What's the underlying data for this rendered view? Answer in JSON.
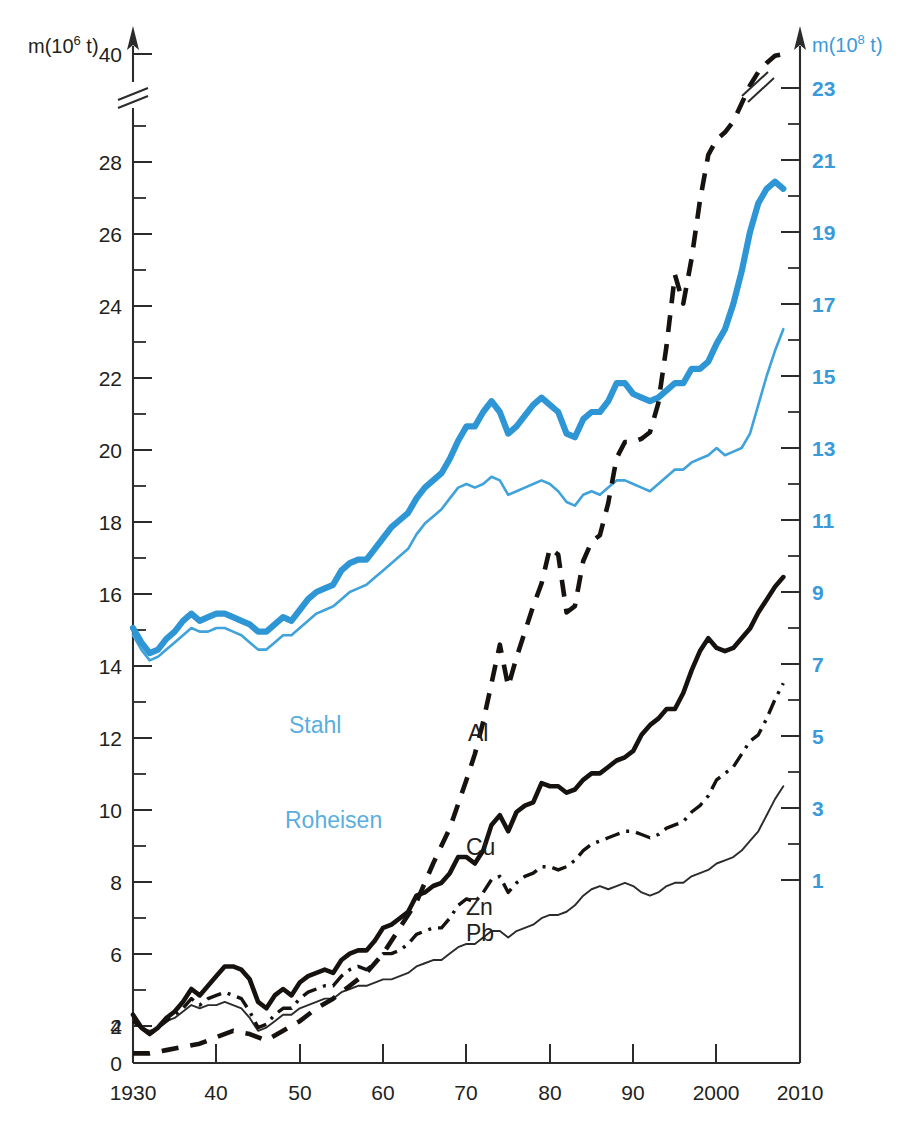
{
  "chart_data": {
    "type": "line",
    "title": "",
    "subtitle": "",
    "xlabel": "",
    "ylabel_left": "m(10^6 t)",
    "ylabel_right": "m(10^8 t)",
    "left_axis": {
      "label_prefix": "m(10",
      "label_exponent": "6",
      "label_suffix": " t)",
      "ticks": [
        0,
        2,
        4,
        6,
        8,
        10,
        12,
        14,
        16,
        18,
        20,
        22,
        24,
        26,
        28,
        40
      ],
      "tick_labels": [
        "0",
        "2",
        "4",
        "6",
        "8",
        "10",
        "12",
        "14",
        "16",
        "18",
        "20",
        "22",
        "24",
        "26",
        "28",
        "40"
      ],
      "has_break": true,
      "break_between": [
        28,
        40
      ],
      "range": [
        0,
        40
      ],
      "unit": "10^6 t"
    },
    "right_axis": {
      "label_prefix": "m(10",
      "label_exponent": "8",
      "label_suffix": " t)",
      "ticks": [
        1,
        3,
        5,
        7,
        9,
        11,
        13,
        15,
        17,
        19,
        21,
        23
      ],
      "tick_labels": [
        "1",
        "3",
        "5",
        "7",
        "9",
        "11",
        "13",
        "15",
        "17",
        "19",
        "21",
        "23"
      ],
      "has_break": true,
      "range": [
        0,
        24
      ],
      "unit": "10^8 t",
      "color": "#3a9ad9"
    },
    "x_axis": {
      "tick_values": [
        1930,
        1940,
        1950,
        1960,
        1970,
        1980,
        1990,
        2000,
        2010
      ],
      "tick_labels": [
        "1930",
        "40",
        "50",
        "60",
        "70",
        "80",
        "90",
        "2000",
        "2010"
      ],
      "range": [
        1930,
        2010
      ]
    },
    "grid": false,
    "legend_position": "inline-labels",
    "series": [
      {
        "name": "Stahl",
        "label": "Stahl",
        "axis": "right",
        "color": "#2e96d4",
        "style": "solid-thick",
        "label_xy": [
          1955,
          10.2
        ],
        "x": [
          1930,
          1931,
          1932,
          1933,
          1934,
          1935,
          1936,
          1937,
          1938,
          1939,
          1940,
          1941,
          1942,
          1943,
          1944,
          1945,
          1946,
          1947,
          1948,
          1949,
          1950,
          1951,
          1952,
          1953,
          1954,
          1955,
          1956,
          1957,
          1958,
          1959,
          1960,
          1961,
          1962,
          1963,
          1964,
          1965,
          1966,
          1967,
          1968,
          1969,
          1970,
          1971,
          1972,
          1973,
          1974,
          1975,
          1976,
          1977,
          1978,
          1979,
          1980,
          1981,
          1982,
          1983,
          1984,
          1985,
          1986,
          1987,
          1988,
          1989,
          1990,
          1991,
          1992,
          1993,
          1994,
          1995,
          1996,
          1997,
          1998,
          1999,
          2000,
          2001,
          2002,
          2003,
          2004,
          2005,
          2006,
          2007,
          2008
        ],
        "y": [
          8.0,
          7.6,
          7.3,
          7.4,
          7.7,
          7.9,
          8.2,
          8.4,
          8.2,
          8.3,
          8.4,
          8.4,
          8.3,
          8.2,
          8.1,
          7.9,
          7.9,
          8.1,
          8.3,
          8.2,
          8.5,
          8.8,
          9.0,
          9.1,
          9.2,
          9.6,
          9.8,
          9.9,
          9.9,
          10.2,
          10.5,
          10.8,
          11.0,
          11.2,
          11.6,
          11.9,
          12.1,
          12.3,
          12.7,
          13.2,
          13.6,
          13.6,
          14.0,
          14.3,
          14.0,
          13.4,
          13.6,
          13.9,
          14.2,
          14.4,
          14.2,
          14.0,
          13.4,
          13.3,
          13.8,
          14.0,
          14.0,
          14.3,
          14.8,
          14.8,
          14.5,
          14.4,
          14.3,
          14.4,
          14.6,
          14.8,
          14.8,
          15.2,
          15.2,
          15.4,
          15.9,
          16.3,
          17.0,
          17.9,
          19.0,
          19.8,
          20.2,
          20.4,
          20.2
        ],
        "y_unit_note": "read on right axis, 10^8 t"
      },
      {
        "name": "Roheisen",
        "label": "Roheisen",
        "axis": "right",
        "color": "#3fa2da",
        "style": "solid-thin",
        "label_xy": [
          1959,
          8.1
        ],
        "x": [
          1930,
          1931,
          1932,
          1933,
          1934,
          1935,
          1936,
          1937,
          1938,
          1939,
          1940,
          1941,
          1942,
          1943,
          1944,
          1945,
          1946,
          1947,
          1948,
          1949,
          1950,
          1951,
          1952,
          1953,
          1954,
          1955,
          1956,
          1957,
          1958,
          1959,
          1960,
          1961,
          1962,
          1963,
          1964,
          1965,
          1966,
          1967,
          1968,
          1969,
          1970,
          1971,
          1972,
          1973,
          1974,
          1975,
          1976,
          1977,
          1978,
          1979,
          1980,
          1981,
          1982,
          1983,
          1984,
          1985,
          1986,
          1987,
          1988,
          1989,
          1990,
          1991,
          1992,
          1993,
          1994,
          1995,
          1996,
          1997,
          1998,
          1999,
          2000,
          2001,
          2002,
          2003,
          2004,
          2005,
          2006,
          2007,
          2008
        ],
        "y": [
          7.8,
          7.4,
          7.1,
          7.2,
          7.4,
          7.6,
          7.8,
          8.0,
          7.9,
          7.9,
          8.0,
          8.0,
          7.9,
          7.8,
          7.6,
          7.4,
          7.4,
          7.6,
          7.8,
          7.8,
          8.0,
          8.2,
          8.4,
          8.5,
          8.6,
          8.8,
          9.0,
          9.1,
          9.2,
          9.4,
          9.6,
          9.8,
          10.0,
          10.2,
          10.6,
          10.9,
          11.1,
          11.3,
          11.6,
          11.9,
          12.0,
          11.9,
          12.0,
          12.2,
          12.1,
          11.7,
          11.8,
          11.9,
          12.0,
          12.1,
          12.0,
          11.8,
          11.5,
          11.4,
          11.7,
          11.8,
          11.7,
          11.9,
          12.1,
          12.1,
          12.0,
          11.9,
          11.8,
          12.0,
          12.2,
          12.4,
          12.4,
          12.6,
          12.7,
          12.8,
          13.0,
          12.8,
          12.9,
          13.0,
          13.4,
          14.2,
          15.0,
          15.7,
          16.3
        ],
        "y_unit_note": "read on left axis scale positions"
      },
      {
        "name": "Al",
        "label": "Al",
        "axis": "left",
        "color": "#16120f",
        "style": "dashed",
        "label_xy": [
          1968,
          9.8
        ],
        "x": [
          1930,
          1932,
          1934,
          1936,
          1938,
          1940,
          1942,
          1944,
          1946,
          1948,
          1950,
          1952,
          1954,
          1956,
          1958,
          1960,
          1962,
          1964,
          1966,
          1968,
          1970,
          1971,
          1972,
          1973,
          1974,
          1975,
          1976,
          1977,
          1978,
          1979,
          1980,
          1981,
          1982,
          1983,
          1984,
          1985,
          1986,
          1987,
          1988,
          1989,
          1990,
          1991,
          1992,
          1993,
          1994,
          1995,
          1996,
          1997,
          1998,
          1999,
          2000,
          2001,
          2002,
          2003,
          2004,
          2005,
          2006,
          2007,
          2008
        ],
        "y": [
          0.3,
          0.3,
          0.4,
          0.5,
          0.6,
          0.8,
          1.0,
          0.9,
          0.7,
          1.0,
          1.3,
          1.7,
          2.0,
          2.4,
          2.8,
          3.4,
          4.2,
          5.0,
          6.2,
          7.3,
          8.8,
          9.6,
          10.6,
          11.8,
          13.0,
          11.7,
          12.6,
          13.4,
          14.2,
          14.9,
          16.0,
          15.8,
          14.0,
          14.2,
          15.6,
          16.2,
          16.4,
          17.4,
          18.8,
          19.3,
          19.3,
          19.4,
          19.6,
          20.5,
          22.3,
          24.5,
          23.6,
          25.0,
          26.8,
          28.8,
          30.5,
          31.3,
          32.5,
          34.5,
          36.5,
          38.0,
          39.0,
          39.8,
          40.0
        ],
        "has_break_near_top": true,
        "y_unit_note": "10^6 t, left axis (axis broken between 28 and 40)"
      },
      {
        "name": "Cu",
        "label": "Cu",
        "axis": "left",
        "color": "#16120f",
        "style": "solid-thick",
        "label_xy": [
          1968,
          7.1
        ],
        "x": [
          1930,
          1931,
          1932,
          1933,
          1934,
          1935,
          1936,
          1937,
          1938,
          1939,
          1940,
          1941,
          1942,
          1943,
          1944,
          1945,
          1946,
          1947,
          1948,
          1949,
          1950,
          1951,
          1952,
          1953,
          1954,
          1955,
          1956,
          1957,
          1958,
          1959,
          1960,
          1961,
          1962,
          1963,
          1964,
          1965,
          1966,
          1967,
          1968,
          1969,
          1970,
          1971,
          1972,
          1973,
          1974,
          1975,
          1976,
          1977,
          1978,
          1979,
          1980,
          1981,
          1982,
          1983,
          1984,
          1985,
          1986,
          1987,
          1988,
          1989,
          1990,
          1991,
          1992,
          1993,
          1994,
          1995,
          1996,
          1997,
          1998,
          1999,
          2000,
          2001,
          2002,
          2003,
          2004,
          2005,
          2006,
          2007,
          2008
        ],
        "y": [
          1.5,
          1.1,
          0.9,
          1.1,
          1.4,
          1.6,
          1.9,
          2.3,
          2.1,
          2.4,
          2.7,
          3.0,
          3.0,
          2.9,
          2.6,
          1.9,
          1.7,
          2.1,
          2.3,
          2.1,
          2.5,
          2.7,
          2.8,
          2.9,
          2.8,
          3.2,
          3.4,
          3.5,
          3.5,
          3.8,
          4.2,
          4.3,
          4.5,
          4.7,
          5.2,
          5.3,
          5.5,
          5.6,
          5.9,
          6.4,
          6.4,
          6.2,
          6.6,
          7.4,
          7.7,
          7.2,
          7.8,
          8.0,
          8.1,
          8.7,
          8.6,
          8.6,
          8.4,
          8.5,
          8.8,
          9.0,
          9.0,
          9.2,
          9.4,
          9.5,
          9.7,
          10.2,
          10.5,
          10.7,
          11.0,
          11.0,
          11.5,
          12.2,
          12.8,
          13.2,
          12.9,
          12.8,
          12.9,
          13.2,
          13.5,
          14.0,
          14.4,
          14.8,
          15.1
        ],
        "y_unit_note": "10^6 t, left axis"
      },
      {
        "name": "Zn",
        "label": "Zn",
        "axis": "left",
        "color": "#16120f",
        "style": "dash-dot",
        "label_xy": [
          1963,
          5.1
        ],
        "x": [
          1930,
          1931,
          1932,
          1933,
          1934,
          1935,
          1936,
          1937,
          1938,
          1939,
          1940,
          1941,
          1942,
          1943,
          1944,
          1945,
          1946,
          1947,
          1948,
          1949,
          1950,
          1951,
          1952,
          1953,
          1954,
          1955,
          1956,
          1957,
          1958,
          1959,
          1960,
          1961,
          1962,
          1963,
          1964,
          1965,
          1966,
          1967,
          1968,
          1969,
          1970,
          1971,
          1972,
          1973,
          1974,
          1975,
          1976,
          1977,
          1978,
          1979,
          1980,
          1981,
          1982,
          1983,
          1984,
          1985,
          1986,
          1987,
          1988,
          1989,
          1990,
          1991,
          1992,
          1993,
          1994,
          1995,
          1996,
          1997,
          1998,
          1999,
          2000,
          2001,
          2002,
          2003,
          2004,
          2005,
          2006,
          2007,
          2008
        ],
        "y": [
          1.3,
          1.1,
          0.9,
          1.1,
          1.3,
          1.5,
          1.7,
          2.0,
          1.8,
          2.0,
          2.1,
          2.2,
          2.1,
          2.0,
          1.6,
          1.1,
          1.2,
          1.5,
          1.7,
          1.7,
          2.0,
          2.2,
          2.3,
          2.4,
          2.4,
          2.7,
          2.9,
          3.0,
          2.9,
          3.1,
          3.4,
          3.4,
          3.5,
          3.7,
          4.0,
          4.1,
          4.2,
          4.2,
          4.5,
          4.9,
          5.1,
          5.0,
          5.3,
          5.7,
          5.8,
          5.3,
          5.6,
          5.8,
          5.9,
          6.1,
          6.1,
          6.0,
          6.1,
          6.3,
          6.6,
          6.8,
          6.9,
          7.0,
          7.1,
          7.2,
          7.2,
          7.1,
          7.0,
          7.1,
          7.3,
          7.4,
          7.5,
          7.8,
          8.0,
          8.3,
          8.8,
          9.0,
          9.2,
          9.6,
          10.0,
          10.2,
          10.7,
          11.3,
          11.8
        ],
        "y_unit_note": "10^6 t, left axis"
      },
      {
        "name": "Pb",
        "label": "Pb",
        "axis": "left",
        "color": "#2b2b2b",
        "style": "solid-thin",
        "label_xy": [
          1963,
          3.4
        ],
        "x": [
          1930,
          1931,
          1932,
          1933,
          1934,
          1935,
          1936,
          1937,
          1938,
          1939,
          1940,
          1941,
          1942,
          1943,
          1944,
          1945,
          1946,
          1947,
          1948,
          1949,
          1950,
          1951,
          1952,
          1953,
          1954,
          1955,
          1956,
          1957,
          1958,
          1959,
          1960,
          1961,
          1962,
          1963,
          1964,
          1965,
          1966,
          1967,
          1968,
          1969,
          1970,
          1971,
          1972,
          1973,
          1974,
          1975,
          1976,
          1977,
          1978,
          1979,
          1980,
          1981,
          1982,
          1983,
          1984,
          1985,
          1986,
          1987,
          1988,
          1989,
          1990,
          1991,
          1992,
          1993,
          1994,
          1995,
          1996,
          1997,
          1998,
          1999,
          2000,
          2001,
          2002,
          2003,
          2004,
          2005,
          2006,
          2007,
          2008
        ],
        "y": [
          1.3,
          1.1,
          1.0,
          1.1,
          1.3,
          1.4,
          1.6,
          1.8,
          1.7,
          1.8,
          1.8,
          1.9,
          1.8,
          1.7,
          1.4,
          1.0,
          1.1,
          1.3,
          1.5,
          1.5,
          1.7,
          1.8,
          1.9,
          2.0,
          2.0,
          2.2,
          2.3,
          2.4,
          2.4,
          2.5,
          2.6,
          2.6,
          2.7,
          2.8,
          3.0,
          3.1,
          3.2,
          3.2,
          3.4,
          3.6,
          3.7,
          3.7,
          3.9,
          4.1,
          4.1,
          3.9,
          4.1,
          4.2,
          4.3,
          4.5,
          4.6,
          4.6,
          4.7,
          4.9,
          5.2,
          5.4,
          5.5,
          5.4,
          5.5,
          5.6,
          5.5,
          5.3,
          5.2,
          5.3,
          5.5,
          5.6,
          5.6,
          5.8,
          5.9,
          6.0,
          6.2,
          6.3,
          6.4,
          6.6,
          6.9,
          7.2,
          7.7,
          8.2,
          8.6
        ],
        "y_unit_note": "10^6 t, left axis"
      }
    ]
  },
  "labels": {
    "stahl": "Stahl",
    "roheisen": "Roheisen",
    "al": "Al",
    "cu": "Cu",
    "zn": "Zn",
    "pb": "Pb"
  },
  "axis_titles": {
    "left_prefix": "m(10",
    "left_exp": "6",
    "left_suffix": " t)",
    "right_prefix": "m(10",
    "right_exp": "8",
    "right_suffix": " t)"
  },
  "left_tick_labels": [
    "40",
    "28",
    "26",
    "24",
    "22",
    "20",
    "18",
    "16",
    "14",
    "12",
    "10",
    "8",
    "6",
    "4",
    "2",
    "0"
  ],
  "right_tick_labels": [
    "23",
    "21",
    "19",
    "17",
    "15",
    "13",
    "11",
    "9",
    "7",
    "5",
    "3",
    "1"
  ],
  "x_tick_labels": [
    "1930",
    "40",
    "50",
    "60",
    "70",
    "80",
    "90",
    "2000",
    "2010"
  ],
  "colors": {
    "blue": "#2e96d4",
    "blue_light": "#3fa2da",
    "blue_label": "#5aaee0",
    "blue_tick": "#3a9ad9",
    "black": "#16120f",
    "axis": "#2b2b2b"
  }
}
